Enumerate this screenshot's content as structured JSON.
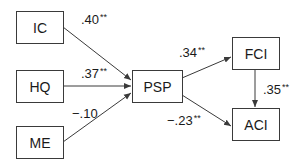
{
  "diagram": {
    "type": "path-model",
    "nodes": [
      {
        "id": "IC",
        "label": "IC"
      },
      {
        "id": "HQ",
        "label": "HQ"
      },
      {
        "id": "ME",
        "label": "ME"
      },
      {
        "id": "PSP",
        "label": "PSP"
      },
      {
        "id": "FCI",
        "label": "FCI"
      },
      {
        "id": "ACI",
        "label": "ACI"
      }
    ],
    "edges": [
      {
        "from": "IC",
        "to": "PSP",
        "coef": ".40",
        "sig": "**"
      },
      {
        "from": "HQ",
        "to": "PSP",
        "coef": ".37",
        "sig": "**"
      },
      {
        "from": "ME",
        "to": "PSP",
        "coef": "−.10",
        "sig": ""
      },
      {
        "from": "PSP",
        "to": "FCI",
        "coef": ".34",
        "sig": "**"
      },
      {
        "from": "PSP",
        "to": "ACI",
        "coef": "−.23",
        "sig": "**"
      },
      {
        "from": "FCI",
        "to": "ACI",
        "coef": ".35",
        "sig": "**"
      }
    ],
    "colors": {
      "line": "#3a3a3a",
      "text": "#1a1a1a",
      "background": "#ffffff"
    }
  }
}
